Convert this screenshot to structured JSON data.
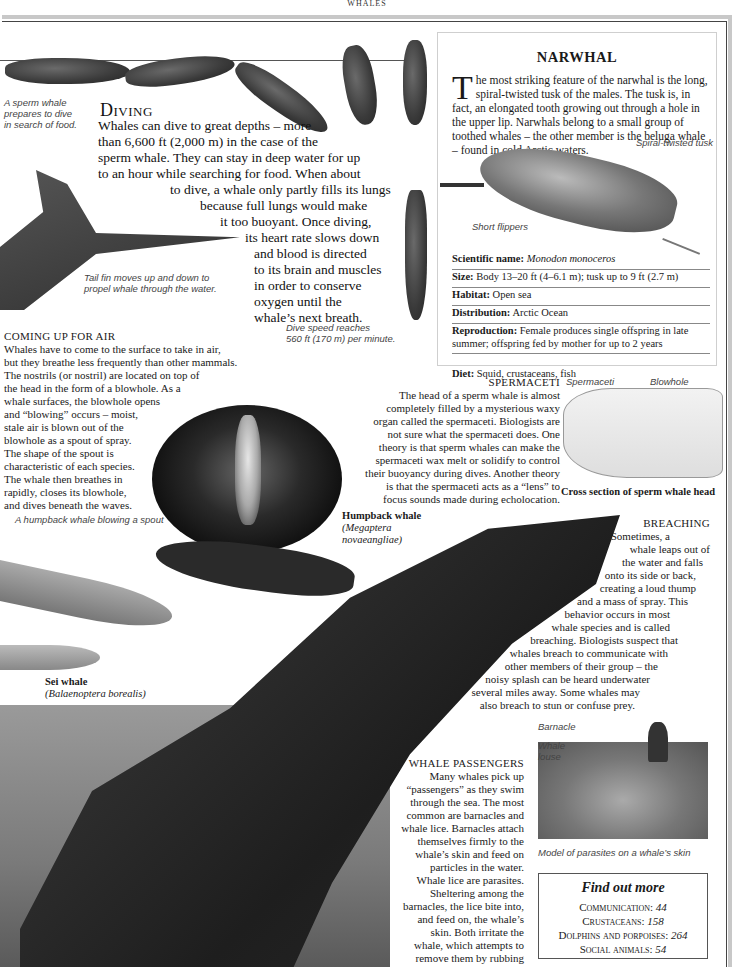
{
  "running_head": "WHALES",
  "diving": {
    "title": "Diving",
    "body_lines": [
      "Whales can dive to great depths – more",
      "than 6,600 ft (2,000 m) in the case of the",
      "sperm whale. They can stay in deep water for up",
      "to an hour while searching for food. When about",
      "to dive, a whale only partly fills its lungs",
      "because full lungs would make",
      "it too buoyant. Once diving,",
      "its heart rate slows down",
      "and blood is directed",
      "to its brain and muscles",
      "in order to conserve",
      "oxygen until the",
      "whale’s next breath."
    ],
    "captions": {
      "sperm_whale": [
        "A sperm whale",
        "prepares to dive",
        "in search of food."
      ],
      "tail_fin": [
        "Tail fin moves up and down to",
        "propel whale through the water."
      ],
      "dive_speed": [
        "Dive speed reaches",
        "560 ft (170 m) per minute."
      ]
    }
  },
  "narwhal": {
    "title": "NARWHAL",
    "intro_dropcap": "T",
    "intro": "he most striking feature of the narwhal is the long, spiral-twisted tusk of the males. The tusk is, in fact, an elongated tooth growing out through a hole in the upper lip. Narwhals belong to a small group of toothed whales – the other member is the beluga whale – found in cold Arctic waters.",
    "labels": {
      "tusk": "Spiral-twisted tusk",
      "flippers": "Short flippers"
    },
    "facts": [
      {
        "label": "Scientific name:",
        "value": "Monodon monoceros",
        "italic": true
      },
      {
        "label": "Size:",
        "value": "Body 13–20 ft (4–6.1 m); tusk up to 9 ft (2.7 m)"
      },
      {
        "label": "Habitat:",
        "value": "Open sea"
      },
      {
        "label": "Distribution:",
        "value": "Arctic Ocean"
      },
      {
        "label": "Reproduction:",
        "value": "Female produces single offspring in late summer; offspring fed by mother for up to 2 years"
      },
      {
        "label": "Diet:",
        "value": "Squid, crustaceans, fish"
      }
    ]
  },
  "coming_up": {
    "title": "COMING UP FOR AIR",
    "body_lines": [
      "Whales have to come to the surface to take in air,",
      "but they breathe less frequently than other mammals.",
      "The nostrils (or nostril) are located on top of",
      "the head in the form of a blowhole. As a",
      "whale surfaces, the blowhole opens",
      "and “blowing” occurs – moist,",
      "stale air is blown out of the",
      "blowhole as a spout of spray.",
      "The shape of the spout is",
      "characteristic of each species.",
      "The whale then breathes in",
      "rapidly, closes its blowhole,",
      "and dives beneath the waves."
    ],
    "photo_caption": "A humpback whale blowing a spout"
  },
  "spermaceti": {
    "title": "SPERMACETI",
    "body_lines": [
      "The head of a sperm whale is almost",
      "completely filled by a mysterious waxy",
      "organ called the spermaceti. Biologists are",
      "not sure what the spermaceti does. One",
      "theory is that sperm whales can make the",
      "spermaceti wax melt or solidify to control",
      "their buoyancy during dives. Another theory",
      "is that the spermaceti acts as a “lens” to",
      "focus sounds made during echolocation."
    ],
    "diagram_labels": {
      "spermaceti": "Spermaceti",
      "blowhole": "Blowhole"
    },
    "diagram_caption": "Cross section of sperm whale head"
  },
  "humpback": {
    "name": "Humpback whale",
    "latin_1": "(Megaptera",
    "latin_2": "novaeangliae)"
  },
  "sei_whale": {
    "name": "Sei whale",
    "latin": "(Balaenoptera borealis)"
  },
  "breaching": {
    "title": "BREACHING",
    "body_lines": [
      "Sometimes, a",
      "whale leaps out of",
      "the water and falls",
      "onto its side or back,",
      "creating a loud thump",
      "and a mass of spray. This",
      "behavior occurs in most",
      "whale species and is called",
      "breaching. Biologists suspect that",
      "whales breach to communicate with",
      "other members of their group – the",
      "noisy splash can be heard underwater",
      "several miles away. Some whales may",
      "also breach to stun or confuse prey."
    ]
  },
  "passengers": {
    "title": "WHALE PASSENGERS",
    "body_lines": [
      "Many whales pick up",
      "“passengers” as they swim",
      "through the sea. The most",
      "common are barnacles and",
      "whale lice. Barnacles attach",
      "themselves firmly to the",
      "whale’s skin and feed on",
      "particles in the water.",
      "Whale lice are parasites.",
      "Sheltering among the",
      "barnacles, the lice bite into,",
      "and feed on, the whale’s",
      "skin. Both irritate the",
      "whale, which attempts to",
      "remove them by rubbing",
      "itself against objects."
    ],
    "labels": {
      "barnacle": "Barnacle",
      "louse_1": "Whale",
      "louse_2": "louse"
    },
    "photo_caption": "Model of parasites on a whale’s skin"
  },
  "find_out_more": {
    "title": "Find out more",
    "items": [
      {
        "topic": "Communication:",
        "page": "44"
      },
      {
        "topic": "Crustaceans:",
        "page": "158"
      },
      {
        "topic": "Dolphins and porpoises:",
        "page": "264"
      },
      {
        "topic": "Social animals:",
        "page": "54"
      }
    ]
  }
}
